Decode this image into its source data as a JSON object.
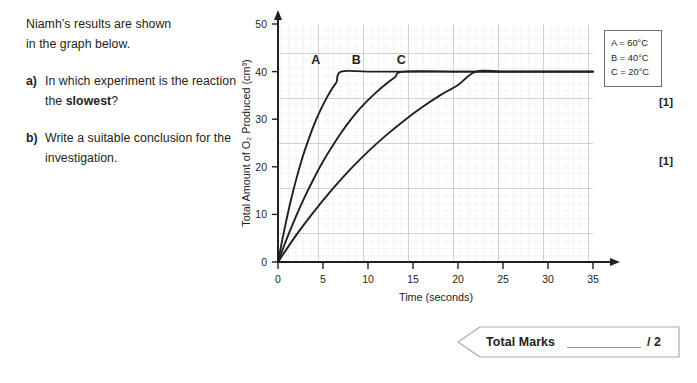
{
  "question": {
    "intro": [
      "Niamh’s results are shown",
      "in the graph below."
    ],
    "parts": [
      {
        "letter": "a)",
        "text_before": "In which experiment is the reaction the ",
        "text_bold": "slowest",
        "text_after": "?",
        "marks": "[1]"
      },
      {
        "letter": "b)",
        "text_before": "Write a suitable conclusion for the investigation.",
        "text_bold": "",
        "text_after": "",
        "marks": "[1]"
      }
    ]
  },
  "legend": {
    "lines": [
      "A = 60°C",
      "B = 40°C",
      "C = 20°C"
    ]
  },
  "footer": {
    "label": "Total Marks",
    "blank": "",
    "out_of": "/ 2"
  },
  "chart_data": {
    "type": "line",
    "title": "",
    "xlabel": "Time (seconds)",
    "ylabel": "Total Amount of O₂ Produced (cm³)",
    "xlim": [
      0,
      35
    ],
    "ylim": [
      0,
      50
    ],
    "xticks": [
      0,
      5,
      10,
      15,
      20,
      25,
      30,
      35
    ],
    "yticks": [
      0,
      10,
      20,
      30,
      40,
      50
    ],
    "grid": true,
    "grid_minor": true,
    "legend_position": "outside-right-top",
    "plateau_value": 40,
    "annotations": [
      {
        "label": "A",
        "x": 4.2,
        "y": 41.5
      },
      {
        "label": "B",
        "x": 8.7,
        "y": 41.5
      },
      {
        "label": "C",
        "x": 13.7,
        "y": 41.5
      }
    ],
    "series": [
      {
        "name": "A",
        "legend": "A = 60°C",
        "color": "#231f20",
        "plateau_time": 7,
        "x": [
          0,
          0.5,
          1,
          1.5,
          2,
          2.5,
          3,
          3.5,
          4,
          4.5,
          5,
          5.5,
          6,
          6.5,
          7,
          10,
          15,
          20,
          25,
          30,
          35
        ],
        "y": [
          0,
          4.9,
          9.4,
          13.5,
          17.2,
          20.6,
          23.6,
          26.3,
          28.8,
          31.0,
          33.0,
          34.8,
          36.4,
          37.8,
          40,
          40,
          40,
          40,
          40,
          40,
          40
        ]
      },
      {
        "name": "B",
        "legend": "B = 40°C",
        "color": "#231f20",
        "plateau_time": 14,
        "x": [
          0,
          1,
          2,
          3,
          4,
          5,
          6,
          7,
          8,
          9,
          10,
          11,
          12,
          13,
          14,
          20,
          25,
          30,
          35
        ],
        "y": [
          0,
          5.0,
          9.6,
          13.8,
          17.6,
          21.1,
          24.2,
          27.1,
          29.7,
          32.0,
          34.0,
          35.8,
          37.4,
          38.8,
          40,
          40,
          40,
          40,
          40
        ]
      },
      {
        "name": "C",
        "legend": "C = 20°C",
        "color": "#231f20",
        "plateau_time": 22,
        "x": [
          0,
          2,
          4,
          6,
          8,
          10,
          12,
          14,
          16,
          18,
          20,
          22,
          25,
          30,
          35
        ],
        "y": [
          0,
          5.6,
          10.6,
          15.2,
          19.4,
          23.2,
          26.6,
          29.7,
          32.5,
          35.0,
          37.2,
          40,
          40,
          40,
          40
        ]
      }
    ]
  }
}
